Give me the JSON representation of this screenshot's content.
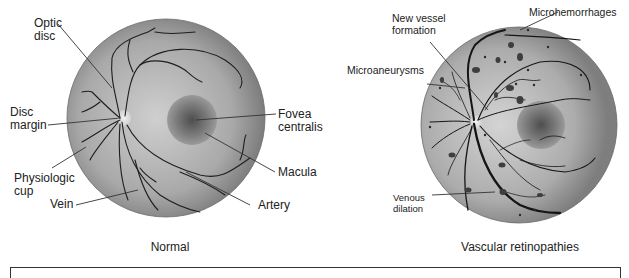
{
  "figure": {
    "panels": [
      {
        "caption": "Normal",
        "labels": {
          "optic_disc": "Optic\ndisc",
          "disc_margin": "Disc\nmargin",
          "physiologic_cup": "Physiologic\ncup",
          "vein": "Vein",
          "fovea_centralis": "Fovea\ncentralis",
          "macula": "Macula",
          "artery": "Artery"
        }
      },
      {
        "caption": "Vascular retinopathies",
        "labels": {
          "new_vessel_formation": "New vessel\nformation",
          "microhemorrhages": "Microhemorrhages",
          "microaneurysms": "Microaneurysms",
          "venous_dilation": "Venous\ndilation"
        }
      }
    ],
    "colors": {
      "fundus_rim": "#7f7f7f",
      "fundus_center": "#c8c8c8",
      "macula_dark": "#555555",
      "vessel": "#1e1e1e",
      "disc": "#e6e6e6"
    }
  }
}
